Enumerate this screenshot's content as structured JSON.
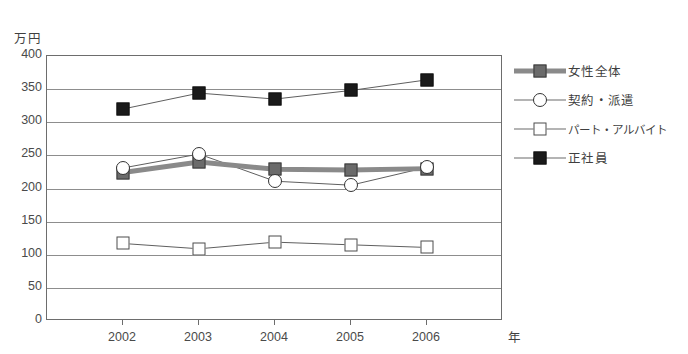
{
  "chart_data": {
    "type": "line",
    "title": "",
    "xlabel": "年",
    "ylabel": "万円",
    "categories": [
      "2002",
      "2003",
      "2004",
      "2005",
      "2006"
    ],
    "ylim": [
      0,
      400
    ],
    "ytick_values": [
      0,
      50,
      100,
      150,
      200,
      250,
      300,
      350,
      400
    ],
    "ytick_labels": [
      "0",
      "50",
      "100",
      "150",
      "200",
      "250",
      "300",
      "350",
      "400"
    ],
    "grid": true,
    "legend_position": "right",
    "series": [
      {
        "name": "女性全体",
        "marker": "filled-gray-square",
        "line": "thick-gray",
        "color": "#6b6b6b",
        "values": [
          224,
          240,
          229,
          228,
          230
        ]
      },
      {
        "name": "契約・派遣",
        "marker": "open-circle",
        "line": "thin",
        "color": "#333333",
        "values": [
          231,
          252,
          211,
          205,
          232
        ]
      },
      {
        "name": "パート・アルバイト",
        "marker": "open-square",
        "line": "thin",
        "color": "#4d4d4d",
        "values": [
          117,
          109,
          119,
          115,
          111
        ]
      },
      {
        "name": "正社員",
        "marker": "filled-black-square",
        "line": "thin",
        "color": "#1a1a1a",
        "values": [
          320,
          344,
          335,
          348,
          364
        ]
      }
    ]
  },
  "axes": {
    "y_unit_label": "万円",
    "x_unit_label": "年"
  },
  "colors": {
    "axis": "#6d6d6d",
    "grid": "#8d8d8d",
    "text": "#3f3f3f",
    "series_overall": "#6b6b6b",
    "series_contract": "#333333",
    "series_parttime": "#4d4d4d",
    "series_fulltime": "#1a1a1a"
  }
}
